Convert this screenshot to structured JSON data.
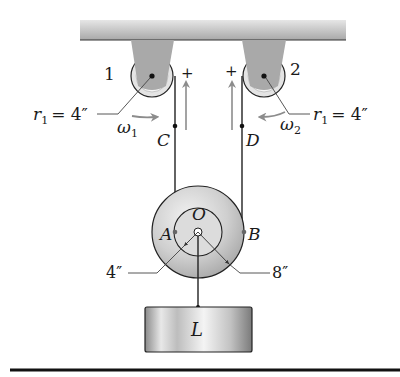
{
  "diagram": {
    "pulley_1": {
      "number": "1",
      "radius_label_var": "r",
      "radius_label_sub": "1",
      "radius_label_value": "= 4″",
      "omega_var": "ω",
      "omega_sub": "1",
      "point": "C",
      "plus": "+"
    },
    "pulley_2": {
      "number": "2",
      "radius_label_var": "r",
      "radius_label_sub": "1",
      "radius_label_value": "= 4″",
      "omega_var": "ω",
      "omega_sub": "2",
      "point": "D",
      "plus": "+"
    },
    "wheel": {
      "center": "O",
      "point_left": "A",
      "point_right": "B",
      "inner_radius": "4″",
      "outer_radius": "8″"
    },
    "load": {
      "label": "L"
    },
    "colors": {
      "ceiling": "#b8b8b8",
      "bracket": "#a9a9a9",
      "arrow": "#8c8c8c",
      "line": "#1a1a1a",
      "wheel": "#c8c8c8"
    }
  }
}
